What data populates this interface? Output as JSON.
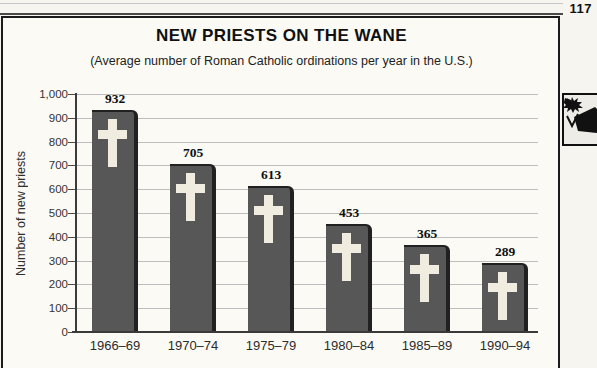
{
  "page": {
    "number": "117"
  },
  "chart": {
    "title": "NEW PRIESTS ON THE WANE",
    "subtitle": "(Average number of Roman Catholic ordinations per year in the U.S.)",
    "y_axis_title": "Number of new priests"
  },
  "margin_icon": "woodcut-illustration",
  "chart_data": {
    "type": "bar",
    "title": "NEW PRIESTS ON THE WANE",
    "subtitle": "(Average number of Roman Catholic ordinations per year in the U.S.)",
    "xlabel": "",
    "ylabel": "Number of new priests",
    "categories": [
      "1966–69",
      "1970–74",
      "1975–79",
      "1980–84",
      "1985–89",
      "1990–94"
    ],
    "values": [
      932,
      705,
      613,
      453,
      365,
      289
    ],
    "value_labels": [
      "932",
      "705",
      "613",
      "453",
      "365",
      "289"
    ],
    "ylim": [
      0,
      1000
    ],
    "ytick_step": 100,
    "ytick_labels": [
      "0",
      "100",
      "200",
      "300",
      "400",
      "500",
      "600",
      "700",
      "800",
      "900",
      "1,000"
    ],
    "grid": true,
    "legend": null,
    "bar_color": "#575757",
    "bar_shadow_color": "#212121",
    "cross_color": "#f0ecdf",
    "gridline_color": "#bdbdbd"
  }
}
